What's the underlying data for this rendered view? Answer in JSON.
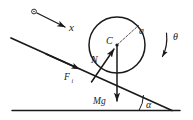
{
  "figure": {
    "background_color": "#ffffff",
    "ink_color": "#1a1a1a"
  },
  "labels": {
    "x_axis": "x",
    "center": "C",
    "radius": "a",
    "rotation": "θ",
    "normal_force": "N",
    "friction_force": "F",
    "friction_subscript": "i",
    "weight": "Mg",
    "incline_angle": "α"
  },
  "elements": {
    "ground_line": "horizontal-ground-surface",
    "incline_line": "inclined-surface",
    "disc": "rolling-disc",
    "radius_line": "dashed-radius-a",
    "normal_arrow": "normal-force-arrow",
    "weight_arrow": "weight-force-arrow",
    "friction_arrow": "friction-force-arrow",
    "x_arrow": "x-axis-direction-arrow",
    "theta_arrow": "rotation-direction-arc-arrow",
    "alpha_arc": "incline-angle-arc",
    "origin_marker": "x-axis-origin-circle",
    "center_marker": "disc-center-point"
  },
  "geometry": {
    "disc_center_x": 117,
    "disc_center_y": 45,
    "disc_radius": 28,
    "ground_y": 110,
    "incline_angle_degrees": 23
  }
}
